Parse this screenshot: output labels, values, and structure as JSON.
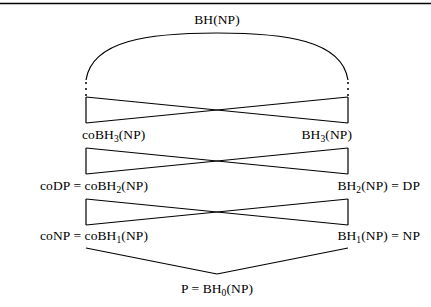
{
  "figure": {
    "kind": "boolean-hierarchy-lattice",
    "top_rule": {
      "visible": true,
      "color": "#000000"
    },
    "background_color": "#ffffff",
    "line_color": "#000000",
    "text_color": "#000000"
  },
  "labels": {
    "top": "BH(NP)",
    "level3_left": "coBH3(NP)",
    "level3_left_base": "coBH",
    "level3_left_sub": "3",
    "level3_left_tail": "(NP)",
    "level3_right_base": "BH",
    "level3_right_sub": "3",
    "level3_right_tail": "(NP)",
    "level2_left_prefix": "coDP = coBH",
    "level2_left_sub": "2",
    "level2_left_tail": "(NP)",
    "level2_right_prefix": "BH",
    "level2_right_sub": "2",
    "level2_right_tail": "(NP) = DP",
    "level1_left_prefix": "coNP = coBH",
    "level1_left_sub": "1",
    "level1_left_tail": "(NP)",
    "level1_right_prefix": "BH",
    "level1_right_sub": "1",
    "level1_right_tail": "(NP) = NP",
    "bottom_prefix": "P = BH",
    "bottom_sub": "0",
    "bottom_tail": "(NP)"
  },
  "nodes": [
    {
      "id": "bh-np",
      "label": "BH(NP)",
      "x": 217,
      "y": 20
    },
    {
      "id": "cobh3-np",
      "label": "coBH3(NP)",
      "x": 86,
      "y": 136
    },
    {
      "id": "bh3-np",
      "label": "BH3(NP)",
      "x": 348,
      "y": 136
    },
    {
      "id": "codp-cobh2-np",
      "label": "coDP = coBH2(NP)",
      "x": 86,
      "y": 187
    },
    {
      "id": "bh2-np-dp",
      "label": "BH2(NP) = DP",
      "x": 348,
      "y": 187
    },
    {
      "id": "conp-cobh1-np",
      "label": "coNP = coBH1(NP)",
      "x": 86,
      "y": 237
    },
    {
      "id": "bh1-np-np",
      "label": "BH1(NP) = NP",
      "x": 348,
      "y": 237
    },
    {
      "id": "p-bh0-np",
      "label": "P = BH0(NP)",
      "x": 217,
      "y": 288
    }
  ],
  "edges": {
    "arc": {
      "from_x": 86,
      "from_y": 79,
      "to_x": 348,
      "to_y": 79,
      "apex_y": 35
    },
    "ellipsis_left": {
      "x": 86,
      "y_top": 82,
      "y_bottom": 95,
      "dots": 3
    },
    "ellipsis_right": {
      "x": 348,
      "y_top": 82,
      "y_bottom": 95,
      "dots": 3
    },
    "bowties": [
      {
        "id": "bowtie-3",
        "left_x": 86,
        "right_x": 348,
        "top_y": 97,
        "bottom_y": 123
      },
      {
        "id": "bowtie-2",
        "left_x": 86,
        "right_x": 348,
        "top_y": 148,
        "bottom_y": 174
      },
      {
        "id": "bowtie-1",
        "left_x": 86,
        "right_x": 348,
        "top_y": 199,
        "bottom_y": 225
      }
    ],
    "vee": {
      "left_x": 86,
      "left_y": 248,
      "apex_x": 217,
      "apex_y": 274,
      "right_x": 348,
      "right_y": 248
    }
  }
}
